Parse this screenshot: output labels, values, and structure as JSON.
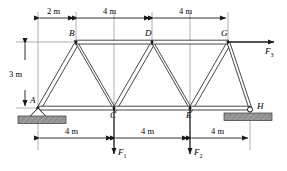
{
  "figure": {
    "type": "statics-truss-free-body-diagram"
  },
  "nodes": [
    {
      "id": "A",
      "label": "A",
      "x": 38,
      "y": 108,
      "support": "pin"
    },
    {
      "id": "B",
      "label": "B",
      "x": 76,
      "y": 42,
      "support": "none"
    },
    {
      "id": "C",
      "label": "C",
      "x": 114,
      "y": 108,
      "support": "none"
    },
    {
      "id": "D",
      "label": "D",
      "x": 152,
      "y": 42,
      "support": "none"
    },
    {
      "id": "E",
      "label": "E",
      "x": 190,
      "y": 108,
      "support": "none"
    },
    {
      "id": "G",
      "label": "G",
      "x": 228,
      "y": 42,
      "support": "none"
    },
    {
      "id": "H",
      "label": "H",
      "x": 250,
      "y": 108,
      "support": "roller"
    }
  ],
  "members": [
    {
      "from": "A",
      "to": "B"
    },
    {
      "from": "B",
      "to": "C"
    },
    {
      "from": "C",
      "to": "D"
    },
    {
      "from": "D",
      "to": "E"
    },
    {
      "from": "E",
      "to": "G"
    },
    {
      "from": "G",
      "to": "H"
    },
    {
      "from": "B",
      "to": "D"
    },
    {
      "from": "D",
      "to": "G"
    },
    {
      "from": "A",
      "to": "C"
    },
    {
      "from": "C",
      "to": "E"
    },
    {
      "from": "E",
      "to": "H"
    }
  ],
  "dimensions": {
    "top": [
      {
        "label": "2 m",
        "from_x": 38,
        "to_x": 76
      },
      {
        "label": "4 m",
        "from_x": 76,
        "to_x": 152
      },
      {
        "label": "4 m",
        "from_x": 152,
        "to_x": 228
      }
    ],
    "bottom": [
      {
        "label": "4 m",
        "from_x": 38,
        "to_x": 114
      },
      {
        "label": "4 m",
        "from_x": 114,
        "to_x": 190
      },
      {
        "label": "4 m",
        "from_x": 190,
        "to_x": 250
      }
    ],
    "vertical": {
      "label": "3 m",
      "from_y": 42,
      "to_y": 108
    }
  },
  "forces": [
    {
      "name": "F1",
      "label": "F",
      "subscript": "1",
      "at_node": "C",
      "direction": "down",
      "tip_x": 114,
      "tip_y": 155
    },
    {
      "name": "F2",
      "label": "F",
      "subscript": "2",
      "at_node": "E",
      "direction": "down",
      "tip_x": 190,
      "tip_y": 155
    },
    {
      "name": "F3",
      "label": "F",
      "subscript": "3",
      "at_node": "G",
      "direction": "right",
      "tip_x": 275,
      "tip_y": 42
    }
  ],
  "supports": {
    "pin": {
      "node": "A",
      "ground_x": 18,
      "ground_y": 114,
      "ground_w": 48,
      "ground_h": 8
    },
    "roller": {
      "node": "H",
      "ground_x": 224,
      "ground_y": 114,
      "ground_w": 48,
      "ground_h": 8
    }
  },
  "colors": {
    "line": "#1a1a1a",
    "member_fill": "#ffffff",
    "ground_fill": "#9a9a9a",
    "ground_stroke": "#3a3a3a",
    "dimension": "#2a2a2a",
    "background": "#ffffff"
  }
}
